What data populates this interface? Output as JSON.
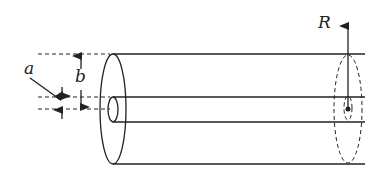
{
  "diagram": {
    "type": "coaxial cable",
    "labels": {
      "a": "a",
      "b": "b",
      "R": "R"
    },
    "stroke_color": "#222222"
  }
}
